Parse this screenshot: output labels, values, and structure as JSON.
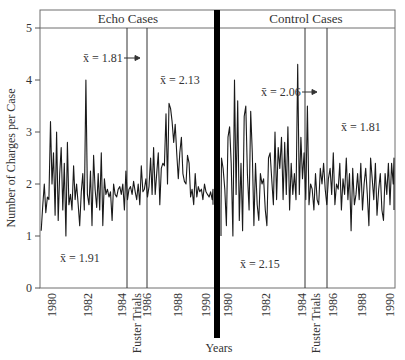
{
  "chart_data": {
    "type": "line",
    "title": "",
    "xlabel": "Years",
    "ylabel": "Number of Charges per Case",
    "ylim": [
      0,
      5
    ],
    "yticks": [
      0,
      1,
      2,
      3,
      4,
      5
    ],
    "grid": false,
    "legend": null,
    "panels": [
      {
        "name": "Echo Cases",
        "xticks": [
          "1980",
          "1982",
          "1984",
          "1986",
          "1988",
          "1990"
        ],
        "event_label": "Fuster Trials",
        "event_window": [
          1984.4,
          1985.6
        ],
        "annotations": [
          {
            "text": "x̄ = 1.91",
            "period": "pre",
            "value": 1.91
          },
          {
            "text": "x̄ = 1.81",
            "period": "during",
            "value": 1.81,
            "arrow": true
          },
          {
            "text": "x̄ = 2.13",
            "period": "post",
            "value": 2.13
          }
        ],
        "series": {
          "name": "Echo charges per case",
          "x": [
            1979.3,
            1979.4,
            1979.5,
            1979.6,
            1979.7,
            1979.8,
            1979.9,
            1980.0,
            1980.1,
            1980.2,
            1980.3,
            1980.4,
            1980.5,
            1980.6,
            1980.7,
            1980.8,
            1980.9,
            1981.0,
            1981.1,
            1981.2,
            1981.3,
            1981.4,
            1981.5,
            1981.6,
            1981.7,
            1981.8,
            1981.9,
            1982.0,
            1982.1,
            1982.2,
            1982.3,
            1982.4,
            1982.5,
            1982.6,
            1982.7,
            1982.8,
            1982.9,
            1983.0,
            1983.1,
            1983.2,
            1983.3,
            1983.4,
            1983.5,
            1983.6,
            1983.7,
            1983.8,
            1983.9,
            1984.0,
            1984.1,
            1984.2,
            1984.3,
            1984.4,
            1984.5,
            1984.6,
            1984.7,
            1984.8,
            1984.9,
            1985.0,
            1985.1,
            1985.2,
            1985.3,
            1985.4,
            1985.5,
            1985.6,
            1985.7,
            1985.8,
            1985.9,
            1986.0,
            1986.1,
            1986.2,
            1986.3,
            1986.4,
            1986.5,
            1986.6,
            1986.7,
            1986.8,
            1986.9,
            1987.0,
            1987.1,
            1987.2,
            1987.3,
            1987.4,
            1987.5,
            1987.6,
            1987.7,
            1987.8,
            1987.9,
            1988.0,
            1988.1,
            1988.2,
            1988.3,
            1988.4,
            1988.5,
            1988.6,
            1988.7,
            1988.8,
            1988.9,
            1989.0,
            1989.1,
            1989.2,
            1989.3,
            1989.4,
            1989.5,
            1989.6,
            1989.7,
            1989.8,
            1989.9,
            1990.0,
            1990.1,
            1990.2,
            1990.3,
            1990.4,
            1990.5,
            1990.6
          ],
          "values": [
            1.1,
            1.6,
            2.0,
            1.45,
            1.75,
            1.7,
            3.2,
            2.0,
            2.6,
            1.4,
            3.0,
            1.3,
            2.2,
            2.7,
            1.5,
            2.4,
            1.0,
            2.8,
            1.6,
            1.8,
            1.5,
            2.35,
            1.7,
            2.0,
            1.6,
            1.2,
            1.85,
            2.2,
            1.5,
            4.0,
            1.8,
            1.6,
            2.25,
            1.2,
            2.55,
            1.9,
            1.55,
            2.2,
            1.5,
            2.6,
            1.2,
            2.1,
            1.8,
            1.9,
            1.75,
            1.85,
            1.3,
            2.0,
            1.8,
            1.75,
            1.9,
            1.95,
            1.8,
            2.0,
            1.5,
            2.25,
            1.7,
            1.9,
            1.95,
            1.8,
            2.05,
            1.85,
            1.7,
            2.0,
            1.6,
            2.35,
            1.85,
            1.9,
            2.1,
            1.75,
            1.95,
            2.5,
            1.8,
            2.7,
            1.8,
            2.2,
            2.6,
            1.6,
            2.3,
            2.4,
            2.35,
            3.35,
            2.0,
            3.55,
            3.45,
            3.2,
            2.8,
            3.15,
            2.6,
            2.1,
            2.6,
            2.9,
            2.2,
            2.05,
            2.0,
            2.55,
            2.4,
            1.75,
            1.9,
            1.6,
            2.2,
            1.75,
            1.95,
            1.85,
            1.9,
            1.7,
            2.0,
            1.85,
            1.8,
            1.75,
            1.85,
            1.7,
            1.9,
            1.6
          ]
        }
      },
      {
        "name": "Control Cases",
        "xticks": [
          "1980",
          "1982",
          "1984",
          "1986",
          "1988",
          "1990"
        ],
        "event_label": "Fuster Trials",
        "event_window": [
          1984.6,
          1985.6
        ],
        "annotations": [
          {
            "text": "x̄ = 2.15",
            "period": "pre",
            "value": 2.15
          },
          {
            "text": "x̄ = 2.06",
            "period": "during",
            "value": 2.06,
            "arrow": true
          },
          {
            "text": "x̄ = 1.81",
            "period": "post",
            "value": 1.81
          }
        ],
        "series": {
          "name": "Control charges per case",
          "x": [
            1979.4,
            1979.5,
            1979.6,
            1979.7,
            1979.8,
            1979.9,
            1980.0,
            1980.1,
            1980.2,
            1980.3,
            1980.4,
            1980.5,
            1980.6,
            1980.7,
            1980.8,
            1980.9,
            1981.0,
            1981.1,
            1981.2,
            1981.3,
            1981.4,
            1981.5,
            1981.6,
            1981.7,
            1981.8,
            1981.9,
            1982.0,
            1982.1,
            1982.2,
            1982.3,
            1982.4,
            1982.5,
            1982.6,
            1982.7,
            1982.8,
            1982.9,
            1983.0,
            1983.1,
            1983.2,
            1983.3,
            1983.4,
            1983.5,
            1983.6,
            1983.7,
            1983.8,
            1983.9,
            1984.0,
            1984.1,
            1984.2,
            1984.3,
            1984.4,
            1984.5,
            1984.6,
            1984.7,
            1984.8,
            1984.9,
            1985.0,
            1985.1,
            1985.2,
            1985.3,
            1985.4,
            1985.5,
            1985.6,
            1985.7,
            1985.8,
            1985.9,
            1986.0,
            1986.1,
            1986.2,
            1986.3,
            1986.4,
            1986.5,
            1986.6,
            1986.7,
            1986.8,
            1986.9,
            1987.0,
            1987.1,
            1987.2,
            1987.3,
            1987.4,
            1987.5,
            1987.6,
            1987.7,
            1987.8,
            1987.9,
            1988.0,
            1988.1,
            1988.2,
            1988.3,
            1988.4,
            1988.5,
            1988.6,
            1988.7,
            1988.8,
            1988.9,
            1989.0,
            1989.1,
            1989.2,
            1989.3,
            1989.4,
            1989.5,
            1989.6,
            1989.7,
            1989.8,
            1989.9,
            1990.0,
            1990.1,
            1990.2,
            1990.3,
            1990.4,
            1990.5
          ],
          "values": [
            1.0,
            1.5,
            2.5,
            2.3,
            1.9,
            1.2,
            2.9,
            3.1,
            2.4,
            1.0,
            4.0,
            1.8,
            3.6,
            1.3,
            2.4,
            1.1,
            3.3,
            3.5,
            2.2,
            1.5,
            3.4,
            2.6,
            1.2,
            2.4,
            1.6,
            1.3,
            2.2,
            2.0,
            2.1,
            1.5,
            1.2,
            2.5,
            2.6,
            2.1,
            1.6,
            3.0,
            1.7,
            2.7,
            2.3,
            2.9,
            1.7,
            2.8,
            1.8,
            3.1,
            1.5,
            2.4,
            1.8,
            2.2,
            1.7,
            4.3,
            1.8,
            2.9,
            2.1,
            2.6,
            1.7,
            3.5,
            1.6,
            2.0,
            1.9,
            1.5,
            2.2,
            1.7,
            1.6,
            2.3,
            2.0,
            2.4,
            1.9,
            1.6,
            2.1,
            2.3,
            1.8,
            2.6,
            1.6,
            2.0,
            1.9,
            2.4,
            1.5,
            2.1,
            1.8,
            2.5,
            1.7,
            2.2,
            1.1,
            2.3,
            1.6,
            1.8,
            2.2,
            1.7,
            2.4,
            1.5,
            2.0,
            2.3,
            1.8,
            1.2,
            2.5,
            2.1,
            1.7,
            2.4,
            1.4,
            1.9,
            2.2,
            1.5,
            1.3,
            2.2,
            1.8,
            2.4,
            1.6,
            2.4,
            2.0,
            2.5,
            1.9,
            1.5
          ]
        }
      }
    ]
  },
  "labels": {
    "panel_left_title": "Echo Cases",
    "panel_right_title": "Control Cases",
    "y_axis_title": "Number of Charges per Case",
    "x_axis_title": "Years",
    "fuster_left": "Fuster Trials",
    "fuster_right": "Fuster Trials",
    "echo_pre_mean": "x̄ = 1.91",
    "echo_during_mean": "x̄ = 1.81",
    "echo_post_mean": "x̄ = 2.13",
    "control_pre_mean": "x̄ = 2.15",
    "control_during_mean": "x̄ = 2.06",
    "control_post_mean": "x̄ = 1.81",
    "y_ticks": [
      "0",
      "1",
      "2",
      "3",
      "4",
      "5"
    ],
    "echo_x_ticks": [
      "1980",
      "1982",
      "1984",
      "1986",
      "1988",
      "1990"
    ],
    "control_x_ticks": [
      "1980",
      "1982",
      "1984",
      "1986",
      "1988",
      "1990"
    ]
  },
  "colors": {
    "line": "#1a1a1a",
    "frame": "#666666",
    "divider": "#000000",
    "text": "#333333"
  }
}
